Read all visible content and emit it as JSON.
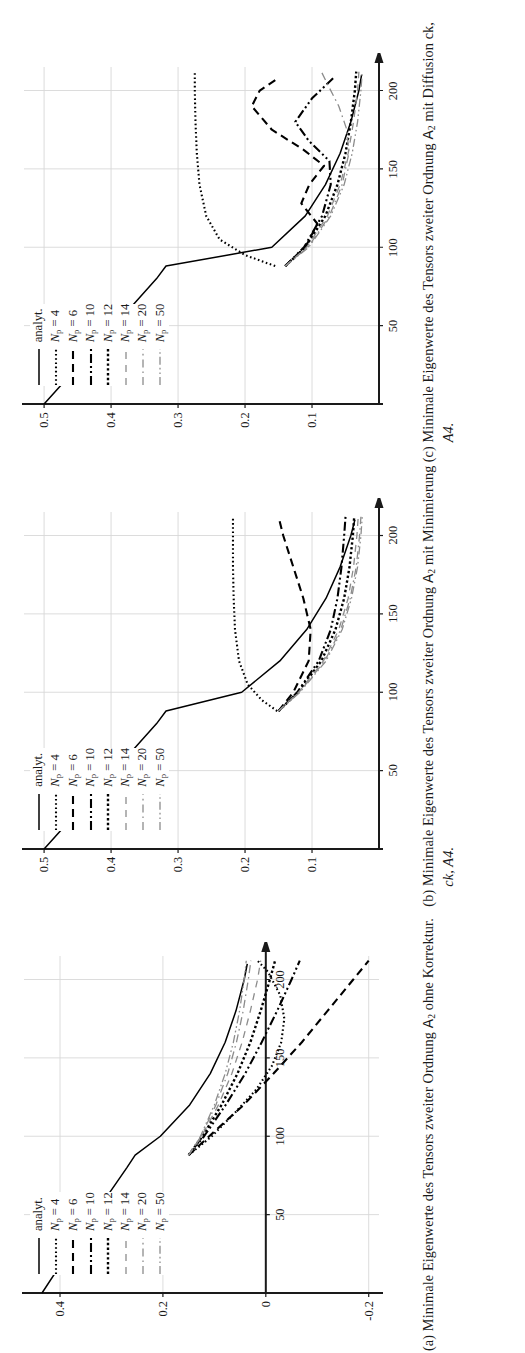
{
  "figure": {
    "orientation": "rotated-90",
    "panels": [
      {
        "tag": "(a)",
        "caption_line1": "Minimale Eigenwerte des Tensors",
        "caption_line2_pre": "zweiter Ordnung ",
        "caption_tensor": "A",
        "caption_tensor_sub": "2",
        "caption_line2_post": " ohne Korrektur.",
        "caption_line3": "",
        "chart_data": {
          "type": "line",
          "title": "",
          "xlabel": "",
          "ylabel": "",
          "xlim": [
            0,
            215
          ],
          "ylim": [
            -0.22,
            0.47
          ],
          "xticks": [
            50,
            100,
            150,
            200
          ],
          "yticks": [
            -0.2,
            0,
            0.2,
            0.4
          ],
          "ytick_labels": [
            "-0.2",
            "0",
            "0.2",
            "0.4"
          ],
          "grid": true,
          "legend_position": "upper-left-inside",
          "series": [
            {
              "name": "analyt.",
              "style": "solid",
              "color": "#000000",
              "x": [
                0,
                20,
                40,
                60,
                80,
                88,
                100,
                120,
                140,
                160,
                180,
                200,
                210
              ],
              "y": [
                0.435,
                0.395,
                0.353,
                0.312,
                0.27,
                0.254,
                0.205,
                0.148,
                0.108,
                0.079,
                0.058,
                0.042,
                0.036
              ]
            },
            {
              "name": "N_p = 4",
              "style": "dotted",
              "color": "#000000",
              "x": [
                88,
                100,
                115,
                130,
                145,
                160,
                175,
                190,
                205,
                212
              ],
              "y": [
                0.15,
                0.105,
                0.06,
                0.018,
                -0.012,
                -0.03,
                -0.036,
                -0.028,
                -0.004,
                0.016
              ]
            },
            {
              "name": "N_p = 6",
              "style": "dashed",
              "color": "#000000",
              "x": [
                88,
                100,
                120,
                140,
                160,
                180,
                200,
                212
              ],
              "y": [
                0.15,
                0.11,
                0.043,
                -0.015,
                -0.07,
                -0.12,
                -0.17,
                -0.2
              ]
            },
            {
              "name": "N_p = 10",
              "style": "dash-dot-dot",
              "color": "#000000",
              "x": [
                88,
                100,
                120,
                140,
                160,
                180,
                200,
                212
              ],
              "y": [
                0.15,
                0.12,
                0.078,
                0.04,
                0.008,
                -0.022,
                -0.05,
                -0.066
              ]
            },
            {
              "name": "N_p = 12",
              "style": "dotted-thick",
              "color": "#000000",
              "x": [
                88,
                100,
                120,
                140,
                160,
                180,
                200,
                212
              ],
              "y": [
                0.15,
                0.123,
                0.086,
                0.055,
                0.03,
                0.01,
                -0.008,
                -0.018
              ]
            },
            {
              "name": "N_p = 14",
              "style": "dashed-light",
              "color": "#8c8c8c",
              "x": [
                88,
                100,
                120,
                140,
                160,
                180,
                200,
                212
              ],
              "y": [
                0.15,
                0.125,
                0.092,
                0.066,
                0.046,
                0.03,
                0.016,
                0.01
              ]
            },
            {
              "name": "N_p = 20",
              "style": "dash-dot-light",
              "color": "#8c8c8c",
              "x": [
                88,
                100,
                120,
                140,
                160,
                180,
                200,
                212
              ],
              "y": [
                0.15,
                0.126,
                0.097,
                0.074,
                0.057,
                0.044,
                0.034,
                0.029
              ]
            },
            {
              "name": "N_p = 50",
              "style": "dash-dot-dot-light",
              "color": "#8c8c8c",
              "x": [
                88,
                100,
                120,
                140,
                160,
                180,
                200,
                212
              ],
              "y": [
                0.15,
                0.127,
                0.1,
                0.079,
                0.063,
                0.051,
                0.042,
                0.038
              ]
            }
          ]
        }
      },
      {
        "tag": "(b)",
        "caption_line1": "Minimale Eigenwerte des Tensors",
        "caption_line2_pre": "zweiter Ordnung ",
        "caption_tensor": "A",
        "caption_tensor_sub": "2",
        "caption_line2_post": " mit Minimierung",
        "caption_line3": "ck, A4.",
        "chart_data": {
          "type": "line",
          "title": "",
          "xlabel": "",
          "ylabel": "",
          "xlim": [
            0,
            215
          ],
          "ylim": [
            0.0,
            0.53
          ],
          "xticks": [
            50,
            100,
            150,
            200
          ],
          "yticks": [
            0.1,
            0.2,
            0.3,
            0.4,
            0.5
          ],
          "ytick_labels": [
            "0.1",
            "0.2",
            "0.3",
            "0.4",
            "0.5"
          ],
          "grid": true,
          "legend_position": "upper-left-inside",
          "series": [
            {
              "name": "analyt.",
              "style": "solid",
              "color": "#000000",
              "x": [
                0,
                20,
                40,
                60,
                80,
                88,
                100,
                120,
                140,
                160,
                180,
                200,
                210
              ],
              "y": [
                0.5,
                0.458,
                0.416,
                0.374,
                0.332,
                0.318,
                0.205,
                0.148,
                0.108,
                0.079,
                0.058,
                0.042,
                0.036
              ]
            },
            {
              "name": "N_p = 4",
              "style": "dotted",
              "color": "#000000",
              "x": [
                88,
                95,
                105,
                120,
                140,
                160,
                180,
                200,
                212
              ],
              "y": [
                0.152,
                0.175,
                0.196,
                0.209,
                0.215,
                0.217,
                0.218,
                0.218,
                0.218
              ]
            },
            {
              "name": "N_p = 6",
              "style": "dashed",
              "color": "#000000",
              "x": [
                88,
                100,
                120,
                140,
                160,
                180,
                200,
                212
              ],
              "y": [
                0.15,
                0.128,
                0.105,
                0.102,
                0.113,
                0.128,
                0.143,
                0.15
              ]
            },
            {
              "name": "N_p = 10",
              "style": "dash-dot-dot",
              "color": "#000000",
              "x": [
                88,
                100,
                120,
                140,
                160,
                180,
                200,
                212
              ],
              "y": [
                0.15,
                0.122,
                0.09,
                0.072,
                0.062,
                0.056,
                0.052,
                0.05
              ]
            },
            {
              "name": "N_p = 12",
              "style": "dotted-thick",
              "color": "#000000",
              "x": [
                88,
                100,
                120,
                140,
                160,
                180,
                200,
                212
              ],
              "y": [
                0.15,
                0.121,
                0.086,
                0.065,
                0.052,
                0.044,
                0.039,
                0.037
              ]
            },
            {
              "name": "N_p = 14",
              "style": "dashed-light",
              "color": "#8c8c8c",
              "x": [
                88,
                100,
                120,
                140,
                160,
                180,
                200,
                212
              ],
              "y": [
                0.15,
                0.12,
                0.083,
                0.06,
                0.046,
                0.038,
                0.033,
                0.031
              ]
            },
            {
              "name": "N_p = 20",
              "style": "dash-dot-light",
              "color": "#8c8c8c",
              "x": [
                88,
                100,
                120,
                140,
                160,
                180,
                200,
                212
              ],
              "y": [
                0.15,
                0.119,
                0.081,
                0.057,
                0.043,
                0.034,
                0.029,
                0.027
              ]
            },
            {
              "name": "N_p = 50",
              "style": "dash-dot-dot-light",
              "color": "#8c8c8c",
              "x": [
                88,
                100,
                120,
                140,
                160,
                180,
                200,
                212
              ],
              "y": [
                0.15,
                0.118,
                0.079,
                0.055,
                0.041,
                0.032,
                0.027,
                0.025
              ]
            }
          ]
        }
      },
      {
        "tag": "(c)",
        "caption_line1": "Minimale Eigenwerte des Tensors",
        "caption_line2_pre": "zweiter Ordnung ",
        "caption_tensor": "A",
        "caption_tensor_sub": "2",
        "caption_line2_post": " mit Diffusion ck,",
        "caption_line3": "A4.",
        "chart_data": {
          "type": "line",
          "title": "",
          "xlabel": "",
          "ylabel": "",
          "xlim": [
            0,
            215
          ],
          "ylim": [
            0.0,
            0.53
          ],
          "xticks": [
            50,
            100,
            150,
            200
          ],
          "yticks": [
            0.1,
            0.2,
            0.3,
            0.4,
            0.5
          ],
          "ytick_labels": [
            "0.1",
            "0.2",
            "0.3",
            "0.4",
            "0.5"
          ],
          "grid": true,
          "legend_position": "upper-left-inside",
          "series": [
            {
              "name": "analyt.",
              "style": "solid",
              "color": "#000000",
              "x": [
                0,
                20,
                40,
                60,
                80,
                88,
                100,
                120,
                140,
                160,
                180,
                200,
                210
              ],
              "y": [
                0.5,
                0.458,
                0.416,
                0.374,
                0.332,
                0.318,
                0.16,
                0.11,
                0.08,
                0.058,
                0.042,
                0.03,
                0.026
              ]
            },
            {
              "name": "N_p = 4",
              "style": "dotted",
              "color": "#000000",
              "x": [
                88,
                95,
                105,
                120,
                140,
                160,
                180,
                200,
                212
              ],
              "y": [
                0.155,
                0.2,
                0.238,
                0.258,
                0.268,
                0.272,
                0.274,
                0.275,
                0.275
              ]
            },
            {
              "name": "N_p = 6",
              "style": "dashed",
              "color": "#000000",
              "x": [
                88,
                100,
                115,
                128,
                140,
                152,
                162,
                175,
                190,
                200,
                208
              ],
              "y": [
                0.14,
                0.11,
                0.092,
                0.116,
                0.104,
                0.082,
                0.112,
                0.16,
                0.19,
                0.178,
                0.15
              ]
            },
            {
              "name": "N_p = 10",
              "style": "dash-dot-dot",
              "color": "#000000",
              "x": [
                88,
                100,
                120,
                140,
                155,
                168,
                180,
                195,
                208
              ],
              "y": [
                0.14,
                0.112,
                0.085,
                0.072,
                0.074,
                0.105,
                0.125,
                0.1,
                0.068
              ]
            },
            {
              "name": "N_p = 12",
              "style": "dotted-thick",
              "color": "#000000",
              "x": [
                88,
                100,
                120,
                140,
                160,
                180,
                200,
                212
              ],
              "y": [
                0.14,
                0.11,
                0.08,
                0.062,
                0.05,
                0.042,
                0.036,
                0.034
              ]
            },
            {
              "name": "N_p = 14",
              "style": "dashed-light",
              "color": "#8c8c8c",
              "x": [
                88,
                100,
                120,
                140,
                160,
                180,
                200,
                212
              ],
              "y": [
                0.14,
                0.108,
                0.077,
                0.058,
                0.046,
                0.038,
                0.032,
                0.03
              ]
            },
            {
              "name": "N_p = 20",
              "style": "dash-dot-light",
              "color": "#8c8c8c",
              "x": [
                88,
                100,
                120,
                140,
                160,
                175,
                190,
                205,
                212
              ],
              "y": [
                0.14,
                0.106,
                0.074,
                0.055,
                0.045,
                0.048,
                0.06,
                0.078,
                0.086
              ]
            },
            {
              "name": "N_p = 50",
              "style": "dash-dot-dot-light",
              "color": "#8c8c8c",
              "x": [
                88,
                100,
                120,
                140,
                160,
                180,
                200,
                212
              ],
              "y": [
                0.14,
                0.105,
                0.072,
                0.052,
                0.04,
                0.032,
                0.027,
                0.025
              ]
            }
          ]
        }
      }
    ],
    "legend_entries": [
      {
        "label": "analyt.",
        "style": "solid"
      },
      {
        "label": "Np = 4",
        "style": "dotted"
      },
      {
        "label": "Np = 6",
        "style": "dashed"
      },
      {
        "label": "Np = 10",
        "style": "dash-dot-dot"
      },
      {
        "label": "Np = 12",
        "style": "dotted-thick"
      },
      {
        "label": "Np = 14",
        "style": "dashed-light"
      },
      {
        "label": "Np = 20",
        "style": "dash-dot-light"
      },
      {
        "label": "Np = 50",
        "style": "dash-dot-dot-light"
      }
    ],
    "axis_colors": {
      "axis": "#1a1a1a",
      "grid": "#d8d8d8",
      "dark_series": "#000000",
      "light_series": "#8c8c8c"
    }
  }
}
